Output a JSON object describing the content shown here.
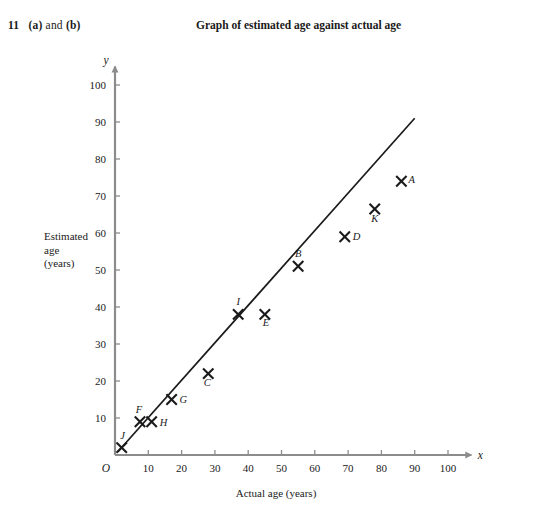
{
  "question": {
    "number": "11",
    "part_a": "(a)",
    "conjunction": "and",
    "part_b": "(b)"
  },
  "chart_title": "Graph of estimated age against actual age",
  "axis": {
    "x_title": "Actual age (years)",
    "y_title_line1": "Estimated",
    "y_title_line2": "age",
    "y_title_line3": "(years)",
    "x_symbol": "x",
    "y_symbol": "y",
    "origin_label": "O"
  },
  "chart_data": {
    "type": "scatter",
    "title": "Graph of estimated age against actual age",
    "xlabel": "Actual age (years)",
    "ylabel": "Estimated age (years)",
    "xlim": [
      0,
      105
    ],
    "ylim": [
      0,
      105
    ],
    "xticks": [
      10,
      20,
      30,
      40,
      50,
      60,
      70,
      80,
      90,
      100
    ],
    "yticks": [
      10,
      20,
      30,
      40,
      50,
      60,
      70,
      80,
      90,
      100
    ],
    "grid": false,
    "legend": "none",
    "marker": "x-cross",
    "points": [
      {
        "label": "A",
        "x": 86,
        "y": 74,
        "label_dx": 7,
        "label_dy": 2
      },
      {
        "label": "B",
        "x": 55,
        "y": 51,
        "label_dx": 0,
        "label_dy": -9
      },
      {
        "label": "C",
        "x": 28,
        "y": 22,
        "label_dx": -1,
        "label_dy": 12
      },
      {
        "label": "D",
        "x": 69,
        "y": 59,
        "label_dx": 8,
        "label_dy": 3
      },
      {
        "label": "E",
        "x": 45,
        "y": 38,
        "label_dx": 1,
        "label_dy": 12
      },
      {
        "label": "F",
        "x": 7.5,
        "y": 9,
        "label_dx": -1,
        "label_dy": -9
      },
      {
        "label": "G",
        "x": 17,
        "y": 15,
        "label_dx": 8,
        "label_dy": 3
      },
      {
        "label": "H",
        "x": 11,
        "y": 9,
        "label_dx": 8,
        "label_dy": 4
      },
      {
        "label": "I",
        "x": 37,
        "y": 38,
        "label_dx": 0,
        "label_dy": -9
      },
      {
        "label": "J",
        "x": 2,
        "y": 2,
        "label_dx": 1,
        "label_dy": -9
      },
      {
        "label": "K",
        "x": 78,
        "y": 66.5,
        "label_dx": 0,
        "label_dy": 13
      }
    ],
    "line_of_best_fit": {
      "x1": 1,
      "y1": 1,
      "x2": 90,
      "y2": 91,
      "description": "line of best fit"
    },
    "colors": {
      "axis": "#8c8c8c",
      "data": "#1a1a1a",
      "background": "#ffffff"
    }
  }
}
